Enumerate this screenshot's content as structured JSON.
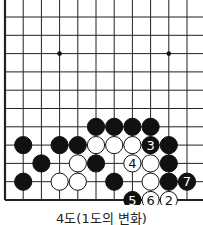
{
  "diagram": {
    "caption": "4도(1도의 변화)",
    "grid": {
      "x0": 5,
      "dx": 18.2,
      "y0": 17,
      "dy": 18.3,
      "cols": 11,
      "rows": 11
    },
    "star_points": [
      [
        3,
        2
      ],
      [
        9,
        2
      ]
    ],
    "stones": [
      {
        "c": 5,
        "r": 6,
        "color": "black"
      },
      {
        "c": 6,
        "r": 6,
        "color": "black"
      },
      {
        "c": 7,
        "r": 6,
        "color": "black"
      },
      {
        "c": 8,
        "r": 6,
        "color": "black"
      },
      {
        "c": 1,
        "r": 7,
        "color": "black"
      },
      {
        "c": 3,
        "r": 7,
        "color": "black"
      },
      {
        "c": 4,
        "r": 7,
        "color": "black"
      },
      {
        "c": 5,
        "r": 7,
        "color": "white"
      },
      {
        "c": 6,
        "r": 7,
        "color": "white"
      },
      {
        "c": 7,
        "r": 7,
        "color": "white"
      },
      {
        "c": 8,
        "r": 7,
        "color": "black",
        "label": "3"
      },
      {
        "c": 9,
        "r": 7,
        "color": "black"
      },
      {
        "c": 2,
        "r": 8,
        "color": "black"
      },
      {
        "c": 4,
        "r": 8,
        "color": "white"
      },
      {
        "c": 5,
        "r": 8,
        "color": "black"
      },
      {
        "c": 7,
        "r": 8,
        "color": "white",
        "label": "4"
      },
      {
        "c": 8,
        "r": 8,
        "color": "white"
      },
      {
        "c": 9,
        "r": 8,
        "color": "black"
      },
      {
        "c": 1,
        "r": 9,
        "color": "black"
      },
      {
        "c": 3,
        "r": 9,
        "color": "white"
      },
      {
        "c": 4,
        "r": 9,
        "color": "white"
      },
      {
        "c": 6,
        "r": 9,
        "color": "black"
      },
      {
        "c": 8,
        "r": 9,
        "color": "white"
      },
      {
        "c": 9,
        "r": 9,
        "color": "black"
      },
      {
        "c": 10,
        "r": 9,
        "color": "black",
        "label": "7"
      },
      {
        "c": 7,
        "r": 10,
        "color": "black",
        "label": "5"
      },
      {
        "c": 8,
        "r": 10,
        "color": "white",
        "label": "6"
      },
      {
        "c": 9,
        "r": 10,
        "color": "white",
        "label": "2"
      }
    ]
  }
}
